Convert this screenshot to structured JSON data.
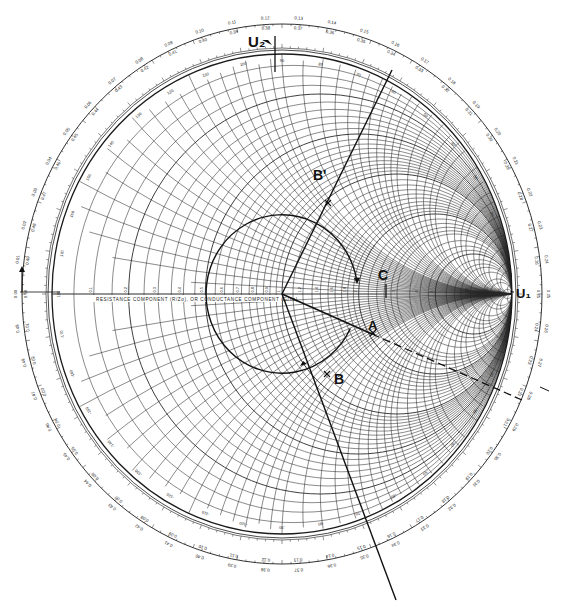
{
  "diagram": {
    "type": "smith-chart",
    "axis_caption": "RESISTANCE COMPONENT (R/Zo), OR CONDUCTANCE COMPONENT (G/Yo)",
    "reactance_caption": "INDUCTIVE REACTANCE COMPONENT (+jX/Zo), OR CAPACITIVE SUSCEPTANCE COMPONENT (+jB/Yo)",
    "neg_reactance_caption": "CAPACITIVE REACTANCE COMPONENT (-jX/Zo), OR INDUCTIVE SUSCEPTANCE (-jB/Yo)",
    "rim_caption": "WAVELENGTHS TOWARD GENERATOR",
    "left_caption": "ANGLE OF REFLECTION COEFFICIENT IN DEGREES",
    "resistance_values": [
      0,
      0.1,
      0.2,
      0.3,
      0.4,
      0.5,
      0.6,
      0.7,
      0.8,
      0.9,
      1.0,
      1.2,
      1.4,
      1.6,
      1.8,
      2.0,
      3.0,
      4.0,
      5.0,
      10,
      20,
      50
    ],
    "reactance_values": [
      0.1,
      0.2,
      0.3,
      0.4,
      0.5,
      0.6,
      0.7,
      0.8,
      0.9,
      1.0,
      1.2,
      1.4,
      1.6,
      1.8,
      2.0,
      3.0,
      4.0,
      5.0,
      10,
      20,
      50
    ],
    "wavelength_ticks_top": [
      "0.11",
      "0.12",
      "0.13",
      "0.14",
      "0.15"
    ],
    "wavelength_ticks_top_inner": [
      "0.39",
      "0.38",
      "0.37",
      "0.36",
      "0.35"
    ],
    "labels": {
      "u2": "U₂",
      "u1": "U₁",
      "A": "A",
      "B": "B",
      "B_prime": "B'",
      "C": "C"
    },
    "points": {
      "A": {
        "gamma_mag": 0.52,
        "gamma_angle_deg": -27
      },
      "B": {
        "gamma_mag": 0.52,
        "gamma_angle_deg": -66
      },
      "B_prime": {
        "gamma_mag": 0.52,
        "gamma_angle_deg": 66
      },
      "C": {
        "r": 3.0,
        "x": 0
      }
    },
    "construction": {
      "swr_circle_radius": 0.33,
      "line_to_B_prime_extends_to_rim": true,
      "line_to_B_extends_to_rim": true,
      "dashed_extension_through_A": true
    },
    "colors": {
      "ink": "#1a1a1a",
      "grid": "#2a2a2a",
      "paper": "#ffffff"
    }
  }
}
